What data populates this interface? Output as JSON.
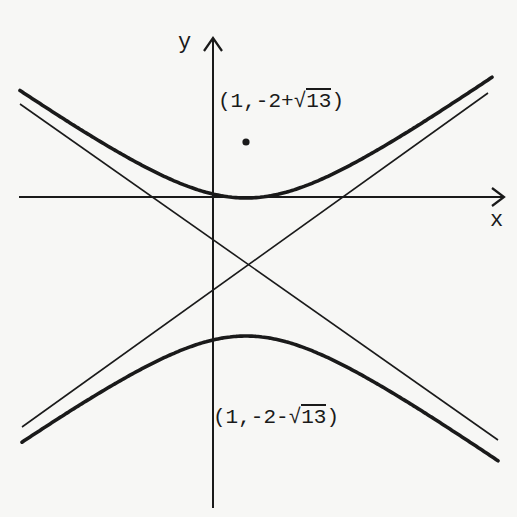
{
  "figure": {
    "type": "hyperbola-sketch",
    "axes": {
      "x_label": "x",
      "y_label": "y"
    },
    "points": [
      {
        "name": "focus-upper",
        "label_prefix": "(1,-2+",
        "label_sqrt_sign": "√",
        "label_radicand": "13",
        "label_suffix": ")",
        "full_label": "(1,-2+√13)",
        "marked_with_dot": true
      },
      {
        "name": "focus-lower",
        "label_prefix": "(1,-2-",
        "label_sqrt_sign": "√",
        "label_radicand": "13",
        "label_suffix": ")",
        "full_label": "(1,-2-√13)",
        "marked_with_dot": false
      }
    ],
    "curves": [
      {
        "name": "upper-branch",
        "opens": "up"
      },
      {
        "name": "lower-branch",
        "opens": "down"
      }
    ],
    "asymptotes": 2,
    "colors": {
      "ink": "#1a1a1a",
      "background": "#f7f7f5"
    }
  }
}
